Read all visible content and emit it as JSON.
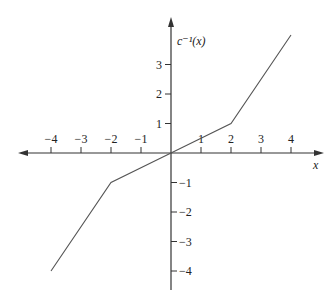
{
  "chart_data": {
    "type": "line",
    "title": "",
    "xlabel": "x",
    "ylabel": "c⁻¹(x)",
    "xlim": [
      -4.5,
      5
    ],
    "ylim": [
      -4.6,
      4.5
    ],
    "x_ticks": [
      -4,
      -3,
      -2,
      -1,
      1,
      2,
      3,
      4
    ],
    "y_ticks": [
      -4,
      -3,
      -2,
      -1,
      1,
      2,
      3
    ],
    "x_tick_labels": [
      "−4",
      "−3",
      "−2",
      "−1",
      "1",
      "2",
      "3",
      "4"
    ],
    "y_tick_labels": [
      "−4",
      "−3",
      "−2",
      "−1",
      "1",
      "2",
      "3"
    ],
    "grid": false,
    "legend": null,
    "series": [
      {
        "name": "c⁻¹(x)",
        "x": [
          -4,
          -2,
          0,
          2,
          4
        ],
        "y": [
          -4,
          -1,
          0,
          1,
          4
        ]
      }
    ],
    "colors": {
      "axis": "#333333",
      "line": "#555555",
      "text": "#222222"
    }
  }
}
